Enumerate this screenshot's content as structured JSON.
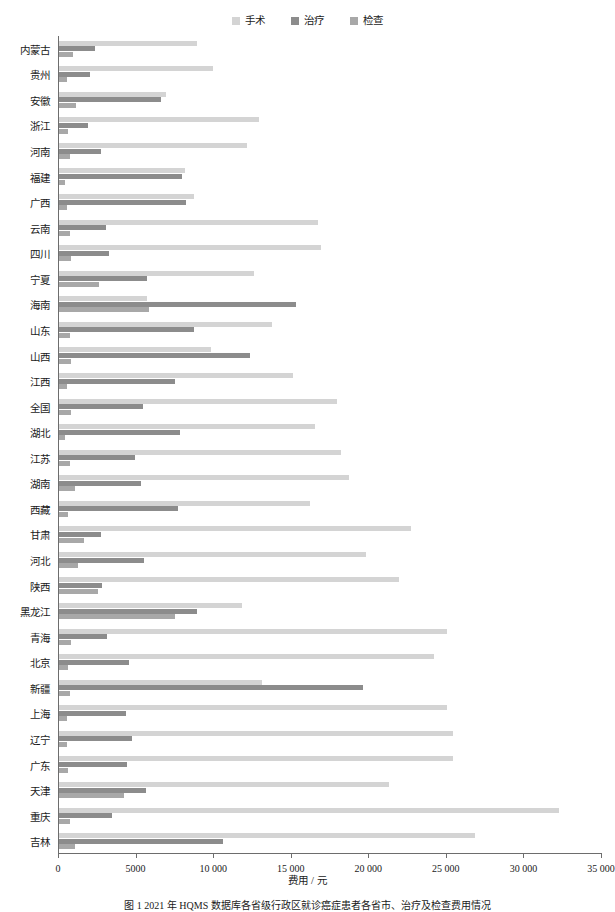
{
  "chart_data": {
    "type": "bar",
    "orientation": "horizontal",
    "title": "",
    "xlabel": "费用 / 元",
    "ylabel": "",
    "xlim": [
      0,
      35000
    ],
    "xticks": [
      0,
      5000,
      10000,
      15000,
      20000,
      25000,
      30000,
      35000
    ],
    "xticklabels": [
      "0",
      "5000",
      "10 000",
      "15 000",
      "20 000",
      "25 000",
      "30 000",
      "35 000"
    ],
    "grid": false,
    "legend_position": "top-center",
    "categories": [
      "内蒙古",
      "贵州",
      "安徽",
      "浙江",
      "河南",
      "福建",
      "广西",
      "云南",
      "四川",
      "宁夏",
      "海南",
      "山东",
      "山西",
      "江西",
      "全国",
      "湖北",
      "江苏",
      "湖南",
      "西藏",
      "甘肃",
      "河北",
      "陕西",
      "黑龙江",
      "青海",
      "北京",
      "新疆",
      "上海",
      "辽宁",
      "广东",
      "天津",
      "重庆",
      "吉林"
    ],
    "series": [
      {
        "name": "手术",
        "color": "#d4d4d4",
        "values": [
          8900,
          9900,
          6900,
          12900,
          12100,
          8100,
          8700,
          16700,
          16900,
          12600,
          5700,
          13700,
          9800,
          15100,
          17900,
          16500,
          18200,
          18700,
          16200,
          22700,
          19800,
          21900,
          11800,
          25000,
          24200,
          13100,
          25000,
          25400,
          25400,
          21300,
          32200,
          26800
        ]
      },
      {
        "name": "治疗",
        "color": "#8c8c8c",
        "values": [
          2300,
          2000,
          6600,
          1900,
          2700,
          7900,
          8200,
          3000,
          3200,
          5700,
          15300,
          8700,
          12300,
          7500,
          5400,
          7800,
          4900,
          5300,
          7700,
          2700,
          5500,
          2800,
          8900,
          3100,
          4500,
          19600,
          4300,
          4700,
          4400,
          5600,
          3400,
          10600
        ]
      },
      {
        "name": "检查",
        "color": "#a8a8a8",
        "values": [
          900,
          500,
          1100,
          600,
          700,
          400,
          500,
          700,
          800,
          2600,
          5800,
          700,
          800,
          500,
          800,
          400,
          700,
          1000,
          600,
          1600,
          1200,
          2500,
          7500,
          800,
          600,
          700,
          500,
          500,
          600,
          4200,
          700,
          1000
        ]
      }
    ]
  },
  "legend": {
    "items": [
      {
        "label": "手术",
        "color": "#d4d4d4"
      },
      {
        "label": "治疗",
        "color": "#8c8c8c"
      },
      {
        "label": "检查",
        "color": "#a8a8a8"
      }
    ]
  },
  "axis": {
    "xlabel": "费用 / 元"
  },
  "caption": {
    "text": "图 1   2021 年 HQMS 数据库各省级行政区就诊癌症患者各省市、治疗及检查费用情况"
  }
}
